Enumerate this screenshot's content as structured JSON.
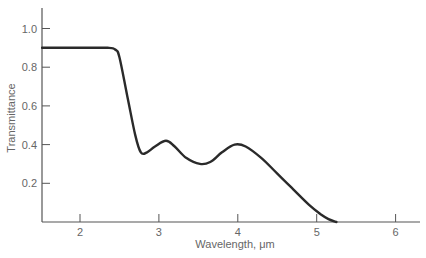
{
  "chart_data": {
    "type": "line",
    "title": "",
    "xlabel": "Wavelength, μm",
    "ylabel": "Transmittance",
    "xlim": [
      1.52,
      6.3
    ],
    "ylim": [
      0,
      1.1
    ],
    "xticks": [
      2,
      3,
      4,
      5,
      6
    ],
    "yticks": [
      0.2,
      0.4,
      0.6,
      0.8,
      1.0
    ],
    "ytick_labels": [
      "0.2",
      "0.4",
      "0.6",
      "0.8",
      "1.0"
    ],
    "xtick_labels": [
      "2",
      "3",
      "4",
      "5",
      "6"
    ],
    "grid": false,
    "legend": null,
    "series": [
      {
        "name": "Transmittance",
        "color": "#2a2a2a",
        "x": [
          1.52,
          2.0,
          2.35,
          2.45,
          2.5,
          2.6,
          2.7,
          2.77,
          2.85,
          2.95,
          3.09,
          3.2,
          3.35,
          3.52,
          3.65,
          3.8,
          3.96,
          4.1,
          4.3,
          4.5,
          4.7,
          4.9,
          5.05,
          5.15,
          5.25
        ],
        "values": [
          0.9,
          0.9,
          0.9,
          0.89,
          0.85,
          0.65,
          0.45,
          0.36,
          0.36,
          0.39,
          0.42,
          0.39,
          0.33,
          0.3,
          0.31,
          0.36,
          0.4,
          0.39,
          0.33,
          0.25,
          0.17,
          0.09,
          0.04,
          0.015,
          0.0
        ]
      }
    ]
  }
}
